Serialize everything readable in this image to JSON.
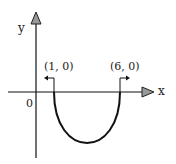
{
  "diagram": {
    "axes": {
      "x_label": "x",
      "y_label": "y",
      "origin_label": "0"
    },
    "points": [
      {
        "label": "(1, 0)",
        "x": 1,
        "y": 0
      },
      {
        "label": "(6, 0)",
        "x": 6,
        "y": 0
      }
    ],
    "curve": {
      "type": "parabola",
      "opens": "up",
      "roots": [
        1,
        6
      ],
      "segment": "below x-axis between roots"
    },
    "colors": {
      "line": "#111111",
      "arrowhead_fill": "#999999"
    }
  }
}
